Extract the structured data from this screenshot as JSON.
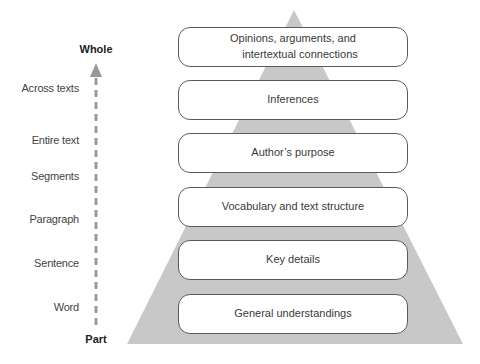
{
  "diagram": {
    "axis": {
      "top_label": "Whole",
      "bottom_label": "Part",
      "arrow_color": "#9a9a9a",
      "levels": [
        {
          "label": "Across texts",
          "y": 88
        },
        {
          "label": "Entire text",
          "y": 140
        },
        {
          "label": "Segments",
          "y": 176
        },
        {
          "label": "Paragraph",
          "y": 219
        },
        {
          "label": "Sentence",
          "y": 263
        },
        {
          "label": "Word",
          "y": 307
        }
      ]
    },
    "pyramid": {
      "fill_color": "#c8c8c8",
      "apex": [
        294,
        10
      ],
      "base_left": [
        127,
        344
      ],
      "base_right": [
        463,
        344
      ],
      "tiers": [
        {
          "line1": "Opinions, arguments, and",
          "line2": "intertextual connections",
          "top": 27
        },
        {
          "line1": "Inferences",
          "line2": "",
          "top": 80
        },
        {
          "line1": "Author’s purpose",
          "line2": "",
          "top": 133
        },
        {
          "line1": "Vocabulary and text structure",
          "line2": "",
          "top": 187
        },
        {
          "line1": "Key details",
          "line2": "",
          "top": 240
        },
        {
          "line1": "General understandings",
          "line2": "",
          "top": 294
        }
      ]
    }
  }
}
